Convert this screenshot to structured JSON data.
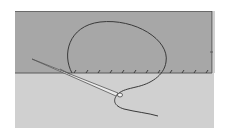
{
  "illustration": {
    "subject": "Needle and thread sewing a hem stitch along a fabric fold",
    "colors": {
      "background": "#ffffff",
      "upper_fabric": "#a7a7a7",
      "lower_fabric": "#d0d0d0",
      "thread": "#3a3a3a",
      "needle": "#e8e8e8",
      "needle_outline": "#555555",
      "fold_edge": "#4a4a4a"
    },
    "elements": [
      "upper-fabric-panel",
      "lower-fabric-panel",
      "fold-edge",
      "stitch-row",
      "thread-loop",
      "thread-tail",
      "needle"
    ]
  }
}
